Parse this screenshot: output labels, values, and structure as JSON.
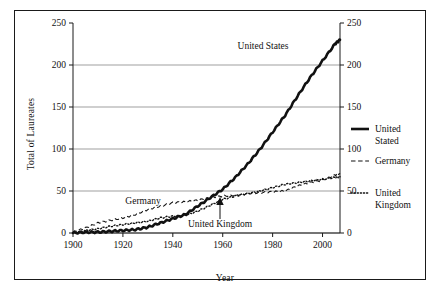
{
  "figure": {
    "border_color": "#1a1a1a",
    "background": "#ffffff"
  },
  "axes": {
    "ylabel": "Total of Laureates",
    "xlabel": "Year",
    "y_left_ticks": [
      "250",
      "200",
      "150",
      "100",
      "50",
      "0"
    ],
    "y_right_ticks": [
      "250",
      "200",
      "150",
      "100",
      "50",
      "0"
    ],
    "x_ticks": [
      "1900",
      "1920",
      "1940",
      "1960",
      "1980",
      "2000"
    ]
  },
  "annotations": [
    {
      "name": "united-states",
      "text": "United States"
    },
    {
      "name": "germany",
      "text": "Germany"
    },
    {
      "name": "united-kingdom",
      "text": "United Kingdom"
    }
  ],
  "legend": {
    "position": "right",
    "items": [
      {
        "label_line1": "United",
        "label_line2": "Stated",
        "style": "solid-thick"
      },
      {
        "label_line1": "Germany",
        "label_line2": "",
        "style": "dashed"
      },
      {
        "label_line1": "United",
        "label_line2": "Kingdom",
        "style": "dotted"
      }
    ]
  },
  "chart_data": {
    "type": "line",
    "title": "",
    "xlabel": "Year",
    "ylabel": "Total of Laureates",
    "xlim": [
      1900,
      2007
    ],
    "ylim": [
      0,
      250
    ],
    "y_right_lim": [
      0,
      250
    ],
    "grid": "horizontal",
    "legend_position": "right",
    "x": [
      1900,
      1905,
      1910,
      1915,
      1920,
      1925,
      1930,
      1935,
      1940,
      1945,
      1950,
      1955,
      1960,
      1965,
      1970,
      1975,
      1980,
      1985,
      1990,
      1995,
      2000,
      2005,
      2007
    ],
    "series": [
      {
        "name": "United Stated",
        "display_name": "United States",
        "style": "solid-thick",
        "values": [
          0,
          1,
          1,
          2,
          3,
          4,
          7,
          12,
          17,
          22,
          32,
          42,
          52,
          66,
          82,
          100,
          120,
          140,
          163,
          185,
          205,
          225,
          230
        ]
      },
      {
        "name": "Germany",
        "display_name": "Germany",
        "style": "dashed",
        "values": [
          1,
          6,
          12,
          15,
          18,
          22,
          28,
          32,
          36,
          37,
          39,
          42,
          44,
          45,
          47,
          48,
          49,
          50,
          56,
          60,
          63,
          69,
          70
        ]
      },
      {
        "name": "United Kingdom",
        "display_name": "United Kingdom",
        "style": "dotted",
        "values": [
          0,
          3,
          5,
          8,
          10,
          12,
          14,
          18,
          20,
          21,
          26,
          33,
          40,
          44,
          47,
          50,
          54,
          58,
          60,
          62,
          64,
          66,
          67
        ]
      }
    ]
  }
}
